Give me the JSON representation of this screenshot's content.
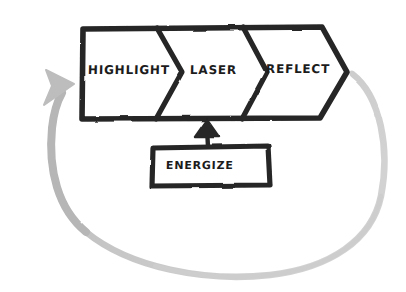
{
  "diagram": {
    "style": "hand-drawn sketch",
    "background_color": "#ffffff",
    "ink_color": "#262626",
    "loop_color": "#b9b9b9",
    "text_color": "#1c1c1c",
    "process_bar": {
      "name": "chevron-process-bar",
      "direction": "left-to-right",
      "steps": [
        {
          "id": "highlight",
          "label": "Highlight",
          "order": 1,
          "shape": "rectangle-with-chevron-right"
        },
        {
          "id": "laser",
          "label": "Laser",
          "order": 2,
          "shape": "chevron"
        },
        {
          "id": "reflect",
          "label": "Reflect",
          "order": 3,
          "shape": "chevron-arrow-head"
        }
      ]
    },
    "input_node": {
      "id": "energize",
      "label": "Energize",
      "shape": "rectangle",
      "connector": {
        "name": "energize-to-process-arrow",
        "type": "straight-arrow",
        "direction": "up",
        "color": "#262626",
        "from": "energize",
        "to": "process-bar"
      }
    },
    "feedback_loop": {
      "name": "feedback-loop-arrow",
      "type": "curved-arrow",
      "color": "#b9b9b9",
      "from": "reflect",
      "to": "highlight",
      "path_direction": "clockwise-around-bottom",
      "arrowhead_at": "highlight"
    }
  }
}
